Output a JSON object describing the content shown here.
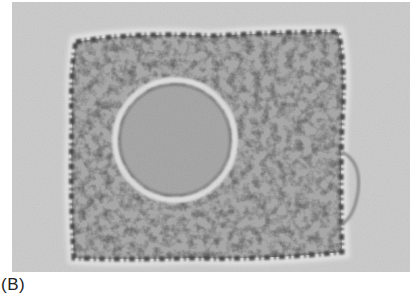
{
  "figure": {
    "panel_label": "(B)",
    "image_description": "Phase-contrast micrograph of a single roughly square cell with granular cytoplasm and a large round nucleus",
    "colors": {
      "background": "#c9c9c9",
      "cytoplasm": "#9a9a9a",
      "cell_edge": "#555555",
      "nucleus": "#a6a6a6",
      "halo": "#e6e6e6"
    }
  }
}
